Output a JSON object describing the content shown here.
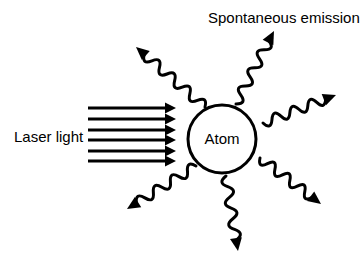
{
  "figure": {
    "kind": "physics-schematic",
    "background_color": "#ffffff",
    "stroke_color": "#000000"
  },
  "labels": {
    "title": "Spontaneous emission",
    "laser": "Laser light",
    "atom": "Atom"
  },
  "atom": {
    "label": "Atom",
    "center_x": 222,
    "center_y": 139,
    "radius": 34,
    "stroke_width": 3,
    "fill": "#ffffff",
    "stroke": "#000000"
  },
  "laser_beam": {
    "label": "Laser light",
    "arrow_count": 6,
    "direction": "left-to-right",
    "x_start": 88,
    "x_end": 176,
    "stroke_width": 3,
    "color": "#000000",
    "arrow_y_positions": [
      108,
      119,
      130,
      140,
      151,
      161
    ]
  },
  "emission_waves": {
    "count": 6,
    "color": "#000000",
    "stroke_width": 3,
    "wavelength": 10,
    "amplitude": 5,
    "arrows": [
      {
        "name": "upper-left",
        "start_x": 205,
        "start_y": 107,
        "end_x": 136,
        "end_y": 47
      },
      {
        "name": "top",
        "start_x": 236,
        "start_y": 104,
        "end_x": 274,
        "end_y": 31
      },
      {
        "name": "upper-right",
        "start_x": 263,
        "start_y": 123,
        "end_x": 336,
        "end_y": 95
      },
      {
        "name": "lower-right",
        "start_x": 260,
        "start_y": 158,
        "end_x": 321,
        "end_y": 204
      },
      {
        "name": "bottom",
        "start_x": 226,
        "start_y": 176,
        "end_x": 238,
        "end_y": 251
      },
      {
        "name": "lower-left",
        "start_x": 196,
        "start_y": 166,
        "end_x": 127,
        "end_y": 209
      }
    ]
  },
  "title_position": {
    "x": 208,
    "y": 23
  },
  "laser_label_position": {
    "x": 14,
    "y": 142
  }
}
